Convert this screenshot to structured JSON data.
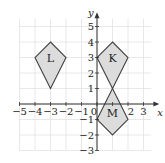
{
  "diagram": {
    "type": "coordinate-grid",
    "axes": {
      "x_label": "x",
      "y_label": "y",
      "x_range": [
        -5,
        3
      ],
      "y_range": [
        -3,
        5
      ],
      "x_ticks": [
        "−5",
        "−4",
        "−3",
        "−2",
        "−1",
        "0",
        "1",
        "2",
        "3"
      ],
      "y_ticks": [
        "5",
        "4",
        "3",
        "2",
        "1",
        "−1",
        "−2",
        "−3"
      ]
    },
    "shapes": [
      {
        "label": "L",
        "vertices": [
          [
            -3,
            4
          ],
          [
            -2,
            3
          ],
          [
            -3,
            1
          ],
          [
            -4,
            3
          ]
        ],
        "label_at": [
          -3,
          3
        ]
      },
      {
        "label": "K",
        "vertices": [
          [
            1,
            4
          ],
          [
            2,
            3
          ],
          [
            1,
            1
          ],
          [
            0,
            3
          ]
        ],
        "label_at": [
          1,
          3
        ]
      },
      {
        "label": "M",
        "vertices": [
          [
            1,
            1
          ],
          [
            2,
            -1
          ],
          [
            1,
            -2
          ],
          [
            0,
            -1
          ]
        ],
        "label_at": [
          1,
          -0.6
        ]
      }
    ],
    "colors": {
      "grid": "#e2e2e2",
      "axis": "#333333",
      "shape_fill": "#dcdcdc",
      "shape_stroke": "#444444"
    }
  }
}
